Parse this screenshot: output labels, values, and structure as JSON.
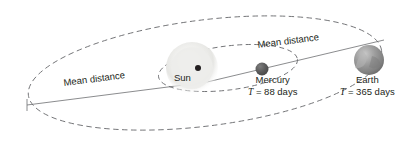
{
  "diagram": {
    "background_color": "#ffffff",
    "line_color": "#6d6e71",
    "text_color": "#231f20",
    "labels": {
      "mean_distance_left": "Mean distance",
      "mean_distance_right": "Mean distance",
      "sun": "Sun",
      "mercury": "Mercury",
      "earth": "Earth",
      "mercury_period_symbol": "T",
      "mercury_period_value": "= 88 days",
      "earth_period_symbol": "T",
      "earth_period_value": "= 365 days"
    },
    "bodies": [
      {
        "name": "Sun",
        "kind": "star",
        "cx": 192,
        "cy": 68,
        "r": 26,
        "color": "#e8e8e6",
        "style": "pale-glow"
      },
      {
        "name": "Mercury",
        "kind": "planet",
        "period_days": 88,
        "cx": 262,
        "cy": 69,
        "r": 6.5,
        "color": "#595959"
      },
      {
        "name": "Earth",
        "kind": "planet",
        "period_days": 365,
        "cx": 369,
        "cy": 60,
        "r": 15,
        "color": "#8a8a8a"
      }
    ],
    "focus_dot": {
      "name": "orbital-focus",
      "cx": 198,
      "cy": 68,
      "r": 3,
      "color": "#231f20"
    },
    "orbits": [
      {
        "name": "earth-orbit",
        "body": "Earth",
        "cx": 205,
        "cy": 73,
        "rx": 178,
        "ry": 53,
        "rotation_deg": -7.2,
        "dashed": true
      },
      {
        "name": "mercury-orbit",
        "body": "Mercury",
        "cx": 228,
        "cy": 68,
        "rx": 70,
        "ry": 22,
        "rotation_deg": -7.2,
        "dashed": true
      }
    ],
    "mean_distance_lines": [
      {
        "name": "mean-distance-line-left",
        "x1": 27,
        "y1": 105,
        "x2": 207,
        "y2": 82
      },
      {
        "name": "mean-distance-line-right",
        "x1": 207,
        "y1": 82,
        "x2": 384,
        "y2": 40
      }
    ]
  }
}
